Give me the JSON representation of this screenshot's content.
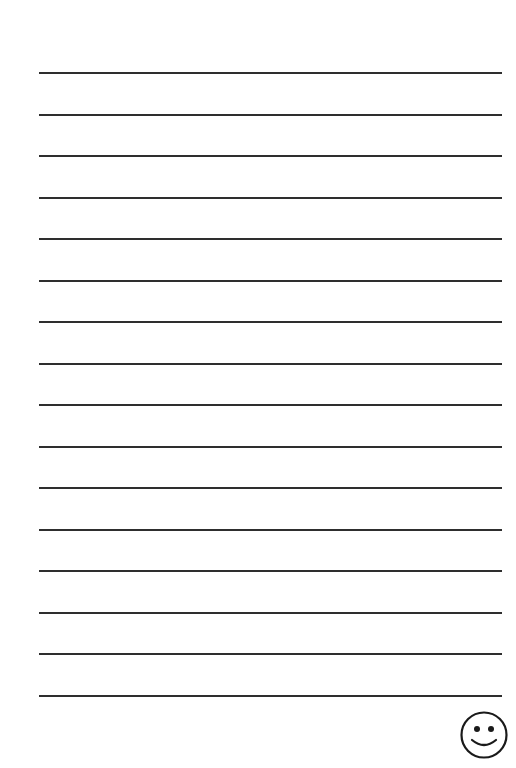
{
  "page": {
    "type": "lined-writing-paper",
    "line_count": 16,
    "line_color": "#2e2e2e",
    "background": "#ffffff"
  },
  "footer": {
    "icon": "smiley-face-icon"
  }
}
